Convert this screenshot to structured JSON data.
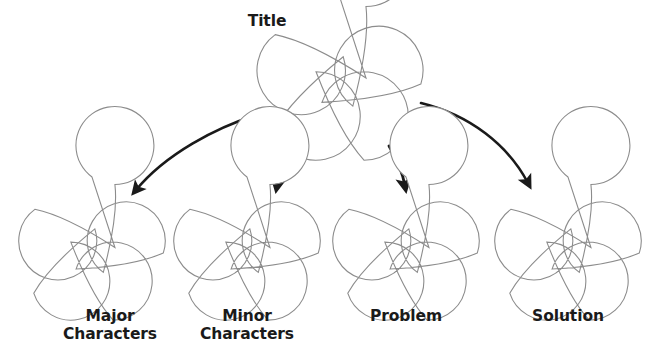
{
  "diagram": {
    "type": "story-map-graphic-organizer",
    "background_color": "#ffffff",
    "shape_outline_color": "#8c8c8c",
    "arrow_color": "#1a1a1a",
    "text_color": "#1a1a1a",
    "root": {
      "label": "Title",
      "shape": "five-lobed-flower",
      "center": {
        "x": 340,
        "y": 83
      },
      "radius": 85
    },
    "children": [
      {
        "id": "major-characters",
        "label": "Major\nCharacters",
        "shape": "five-lobed-flower",
        "center": {
          "x": 92,
          "y": 252
        },
        "radius": 75
      },
      {
        "id": "minor-characters",
        "label": "Minor\nCharacters",
        "shape": "five-lobed-flower",
        "center": {
          "x": 247,
          "y": 252
        },
        "radius": 75
      },
      {
        "id": "problem",
        "label": "Problem",
        "shape": "five-lobed-flower",
        "center": {
          "x": 406,
          "y": 252
        },
        "radius": 75
      },
      {
        "id": "solution",
        "label": "Solution",
        "shape": "five-lobed-flower",
        "center": {
          "x": 568,
          "y": 252
        },
        "radius": 75
      }
    ],
    "connectors": [
      {
        "id": "arrow-to-major-characters",
        "from": "title",
        "to": "major-characters",
        "style": "curved-arrow"
      },
      {
        "id": "arrow-to-minor-characters",
        "from": "title",
        "to": "minor-characters",
        "style": "curved-arrow"
      },
      {
        "id": "arrow-to-problem",
        "from": "title",
        "to": "problem",
        "style": "curved-arrow"
      },
      {
        "id": "arrow-to-solution",
        "from": "title",
        "to": "solution",
        "style": "curved-arrow"
      }
    ]
  }
}
